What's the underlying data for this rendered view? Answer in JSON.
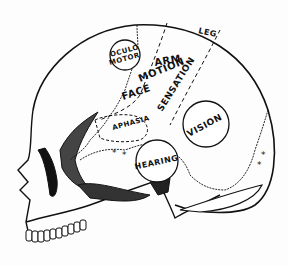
{
  "diagram": {
    "regions": [
      {
        "id": "oculomotor",
        "lines": [
          "OCULO",
          "MOTOR"
        ]
      },
      {
        "id": "leg",
        "label": "LEG"
      },
      {
        "id": "arm",
        "label": "ARM"
      },
      {
        "id": "motion",
        "label": "MOTION"
      },
      {
        "id": "face",
        "label": "FACE"
      },
      {
        "id": "sensation",
        "label": "SENSATION"
      },
      {
        "id": "aphasia",
        "label": "APHASIA"
      },
      {
        "id": "hearing",
        "label": "HEARING"
      },
      {
        "id": "vision",
        "label": "VISION"
      }
    ],
    "markers": {
      "symbol": "*",
      "count_left": 2,
      "count_right": 2
    },
    "colors": {
      "ink": "#111111",
      "paper": "#fdfdfd",
      "shade": "#555555"
    }
  }
}
